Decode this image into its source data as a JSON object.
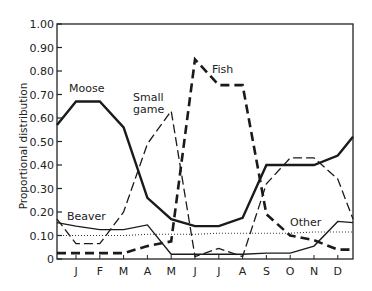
{
  "chart_data": {
    "type": "line",
    "title": "",
    "xlabel": "",
    "ylabel": "Proportional distribution",
    "ylim": [
      0,
      1.0
    ],
    "grid": false,
    "legend": "inline labels",
    "categories": [
      "J",
      "F",
      "M",
      "A",
      "M",
      "J",
      "J",
      "A",
      "S",
      "O",
      "N",
      "D"
    ],
    "y_ticks": [
      "0",
      "0.10",
      "0.20",
      "0.30",
      "0.40",
      "0.50",
      "0.60",
      "0.70",
      "0.80",
      "0.90",
      "1.00"
    ],
    "start_values": {
      "Moose": 0.57,
      "Small game": 0.17,
      "Fish": 0.025,
      "Beaver": 0.155,
      "Other": 0.1
    },
    "end_values": {
      "Moose": 0.52,
      "Small game": 0.17,
      "Fish": 0.04,
      "Beaver": 0.155,
      "Other": 0.115
    },
    "series": [
      {
        "name": "Moose",
        "style": "solid-thick",
        "values": [
          0.67,
          0.67,
          0.56,
          0.26,
          0.17,
          0.14,
          0.14,
          0.175,
          0.4,
          0.4,
          0.4,
          0.44
        ]
      },
      {
        "name": "Small game",
        "style": "dashed-thin",
        "values": [
          0.065,
          0.065,
          0.2,
          0.49,
          0.63,
          0.01,
          0.045,
          0.01,
          0.32,
          0.43,
          0.43,
          0.34
        ]
      },
      {
        "name": "Fish",
        "style": "dashed-thick",
        "values": [
          0.025,
          0.025,
          0.025,
          0.055,
          0.075,
          0.85,
          0.74,
          0.74,
          0.19,
          0.1,
          0.08,
          0.04
        ]
      },
      {
        "name": "Beaver",
        "style": "solid-thin",
        "values": [
          0.14,
          0.125,
          0.125,
          0.145,
          0.02,
          0.02,
          0.02,
          0.02,
          0.025,
          0.025,
          0.055,
          0.16
        ]
      },
      {
        "name": "Other",
        "style": "dotted",
        "values": [
          0.1,
          0.1,
          0.1,
          0.105,
          0.105,
          0.105,
          0.11,
          0.11,
          0.11,
          0.11,
          0.115,
          0.115
        ]
      }
    ],
    "annotations": [
      {
        "text": "Moose",
        "x": "J-F",
        "y": 0.71
      },
      {
        "text": "Small game",
        "x": "M-A",
        "y": 0.62
      },
      {
        "text": "Fish",
        "x": "J-A",
        "y": 0.85
      },
      {
        "text": "Beaver",
        "x": "J",
        "y": 0.18
      },
      {
        "text": "Other",
        "x": "O-N",
        "y": 0.14
      }
    ]
  },
  "labels": {
    "ylabel": "Proportional distribution",
    "moose": "Moose",
    "small1": "Small",
    "small2": "game",
    "fish": "Fish",
    "beaver": "Beaver",
    "other": "Other"
  }
}
